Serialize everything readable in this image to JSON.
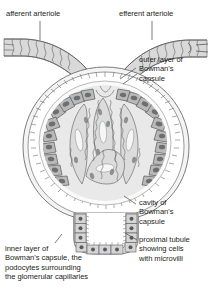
{
  "figure": {
    "type": "anatomical-line-diagram",
    "palette": {
      "background": "#ffffff",
      "ink": "#231f20",
      "line": "#6d6e70",
      "fill_light": "#ededed",
      "fill_mid": "#d9d9d9",
      "fill_dark": "#bdbdbd",
      "fill_darker": "#a0a0a0",
      "nucleus": "#58595b"
    }
  },
  "labels": {
    "afferent_arteriole": "afferent arteriole",
    "efferent_arteriole": "efferent arteriole",
    "outer_layer": "outer layer of\nBowman's\ncapsule",
    "cavity": "cavity of\nBowman's\ncapsule",
    "proximal_tubule": "proximal tubule\nshowing cells\nwith microvilli",
    "inner_layer": "inner layer of\nBowman's capsule, the\npodocytes surrounding\nthe glomerular capillaries"
  },
  "structures": [
    "afferent arteriole",
    "efferent arteriole",
    "outer layer of Bowman's capsule",
    "inner layer of Bowman's capsule (podocytes)",
    "cavity of Bowman's capsule",
    "glomerular capillaries",
    "proximal tubule with microvilli"
  ]
}
